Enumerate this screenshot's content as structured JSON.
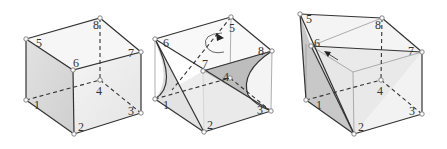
{
  "figures": [
    {
      "name": "cube",
      "labels": {
        "v1": "1",
        "v2": "2",
        "v3": "3",
        "v4": "4",
        "v5": "5",
        "v6": "6",
        "v7": "7",
        "v8": "8"
      }
    },
    {
      "name": "twisted-cube",
      "labels": {
        "v1": "1",
        "v2": "2",
        "v3": "3",
        "v4": "4",
        "v5": "5",
        "v6": "6",
        "v7": "7",
        "v8": "8"
      }
    },
    {
      "name": "sheared-cube",
      "labels": {
        "v1": "1",
        "v2": "2",
        "v3": "3",
        "v4": "4",
        "v5": "5",
        "v6": "6",
        "v7": "7",
        "v8": "8"
      }
    }
  ],
  "colors": {
    "face_light": "#ececec",
    "face_mid": "#d6d6d6",
    "face_dark": "#bdbdbd",
    "edge": "#333333"
  }
}
